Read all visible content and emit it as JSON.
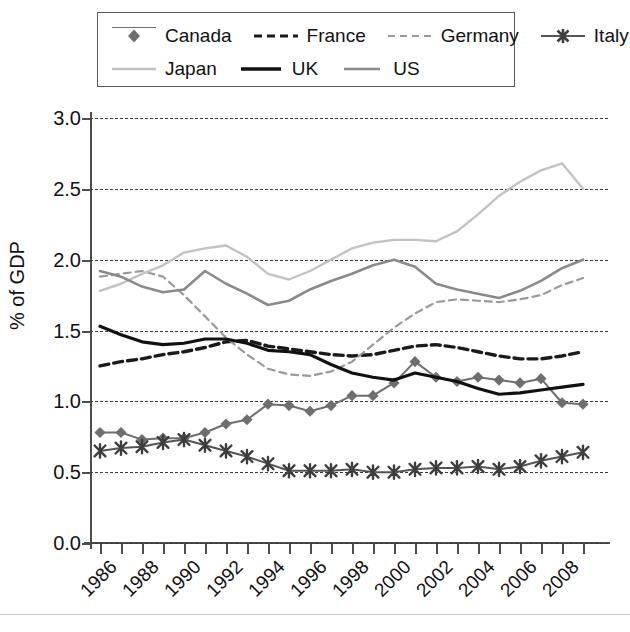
{
  "chart_data": {
    "type": "line",
    "title": "",
    "xlabel": "",
    "ylabel": "% of GDP",
    "ylim": [
      0.0,
      3.0
    ],
    "yticks": [
      "0.0",
      "0.5",
      "1.0",
      "1.5",
      "2.0",
      "2.5",
      "3.0"
    ],
    "grid": true,
    "legend_position": "top",
    "x": [
      1986,
      1987,
      1988,
      1989,
      1990,
      1991,
      1992,
      1993,
      1994,
      1995,
      1996,
      1997,
      1998,
      1999,
      2000,
      2001,
      2002,
      2003,
      2004,
      2005,
      2006,
      2007,
      2008,
      2009
    ],
    "xtick_labels": [
      "1986",
      "1988",
      "1990",
      "1992",
      "1994",
      "1996",
      "1998",
      "2000",
      "2002",
      "2004",
      "2006",
      "2008"
    ],
    "series": [
      {
        "name": "Canada",
        "color": "#6e6e6e",
        "style": "solid-marker",
        "marker": "diamond",
        "values": [
          0.78,
          0.78,
          0.73,
          0.74,
          0.74,
          0.78,
          0.84,
          0.87,
          0.98,
          0.97,
          0.93,
          0.97,
          1.04,
          1.04,
          1.13,
          1.28,
          1.17,
          1.14,
          1.17,
          1.15,
          1.13,
          1.16,
          0.99,
          0.98
        ]
      },
      {
        "name": "France",
        "color": "#1a1a1a",
        "style": "dashed-heavy",
        "marker": "none",
        "values": [
          1.25,
          1.28,
          1.3,
          1.33,
          1.35,
          1.38,
          1.42,
          1.43,
          1.39,
          1.37,
          1.35,
          1.33,
          1.32,
          1.33,
          1.36,
          1.39,
          1.4,
          1.38,
          1.35,
          1.32,
          1.3,
          1.3,
          1.32,
          1.35
        ]
      },
      {
        "name": "Germany",
        "color": "#9a9a9a",
        "style": "dashed-light",
        "marker": "none",
        "values": [
          1.88,
          1.9,
          1.92,
          1.88,
          1.75,
          1.6,
          1.45,
          1.33,
          1.23,
          1.19,
          1.18,
          1.21,
          1.28,
          1.4,
          1.52,
          1.62,
          1.7,
          1.72,
          1.71,
          1.7,
          1.72,
          1.75,
          1.82,
          1.87
        ]
      },
      {
        "name": "Italy",
        "color": "#555555",
        "style": "solid-marker",
        "marker": "cross",
        "values": [
          0.65,
          0.67,
          0.68,
          0.71,
          0.73,
          0.69,
          0.65,
          0.61,
          0.56,
          0.51,
          0.51,
          0.51,
          0.52,
          0.5,
          0.5,
          0.52,
          0.53,
          0.53,
          0.54,
          0.52,
          0.54,
          0.58,
          0.61,
          0.64
        ]
      },
      {
        "name": "Japan",
        "color": "#c2c2c2",
        "style": "solid-light",
        "marker": "none",
        "values": [
          1.78,
          1.83,
          1.9,
          1.96,
          2.05,
          2.08,
          2.1,
          2.02,
          1.9,
          1.86,
          1.92,
          2.0,
          2.08,
          2.12,
          2.14,
          2.14,
          2.13,
          2.2,
          2.32,
          2.45,
          2.55,
          2.63,
          2.68,
          2.5
        ]
      },
      {
        "name": "UK",
        "color": "#111111",
        "style": "solid-heavy",
        "marker": "none",
        "values": [
          1.53,
          1.47,
          1.42,
          1.4,
          1.41,
          1.44,
          1.44,
          1.41,
          1.36,
          1.35,
          1.33,
          1.26,
          1.2,
          1.17,
          1.15,
          1.2,
          1.17,
          1.14,
          1.09,
          1.05,
          1.06,
          1.08,
          1.1,
          1.12
        ]
      },
      {
        "name": "US",
        "color": "#8a8a8a",
        "style": "solid-medium",
        "marker": "none",
        "values": [
          1.92,
          1.88,
          1.81,
          1.77,
          1.79,
          1.92,
          1.83,
          1.76,
          1.68,
          1.71,
          1.79,
          1.85,
          1.9,
          1.96,
          2.0,
          1.95,
          1.83,
          1.79,
          1.76,
          1.73,
          1.78,
          1.85,
          1.94,
          2.0
        ]
      }
    ]
  },
  "legend": {
    "rows": [
      [
        {
          "label": "Canada",
          "icon": "diamond-marker-line-key"
        },
        {
          "label": "France",
          "icon": "dashed-line-key"
        },
        {
          "label": "Germany",
          "icon": "light-dashed-line-key"
        },
        {
          "label": "Italy",
          "icon": "cross-marker-line-key"
        }
      ],
      [
        {
          "label": "Japan",
          "icon": "light-solid-line-key"
        },
        {
          "label": "UK",
          "icon": "bold-solid-line-key"
        },
        {
          "label": "US",
          "icon": "gray-solid-line-key"
        }
      ]
    ]
  },
  "colors": {
    "canada": "#6e6e6e",
    "france": "#1a1a1a",
    "germany": "#9a9a9a",
    "italy": "#555555",
    "japan": "#c2c2c2",
    "uk": "#111111",
    "us": "#8a8a8a",
    "axis": "#4d4d4d",
    "grid": "#3a3a3a",
    "background": "#ffffff"
  }
}
